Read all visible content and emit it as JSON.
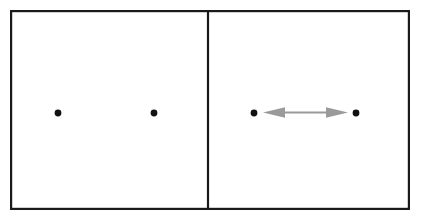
{
  "figure": {
    "background_color": "#ffffff",
    "width": 421,
    "height": 222,
    "frame": {
      "name": "outer-rectangle",
      "x": 10,
      "y": 10,
      "width": 400,
      "height": 200,
      "stroke_color": "#1a1a1a",
      "stroke_width": 2.2,
      "fill_color": "#ffffff"
    },
    "divider": {
      "name": "vertical-divider",
      "x": 208,
      "y_top": 10,
      "y_bottom": 210,
      "stroke_color": "#1a1a1a",
      "stroke_width": 2.2
    },
    "panels": [
      {
        "id": "left-panel",
        "label": "",
        "has_arrow": false,
        "dots": [
          {
            "id": "left-panel-dot-1",
            "cx": 58,
            "cy": 113,
            "r": 3.4,
            "color": "#111111"
          },
          {
            "id": "left-panel-dot-2",
            "cx": 154,
            "cy": 113,
            "r": 3.4,
            "color": "#111111"
          }
        ]
      },
      {
        "id": "right-panel",
        "label": "",
        "has_arrow": true,
        "dots": [
          {
            "id": "right-panel-dot-1",
            "cx": 254,
            "cy": 113,
            "r": 3.4,
            "color": "#111111"
          },
          {
            "id": "right-panel-dot-2",
            "cx": 356,
            "cy": 113,
            "r": 3.4,
            "color": "#111111"
          }
        ],
        "arrow": {
          "id": "double-headed-arrow",
          "color": "#9a9a9a",
          "y": 112.5,
          "x_start": 263,
          "x_end": 348,
          "shaft_width": 2.2,
          "head_length": 22,
          "head_half_height": 5.2,
          "heads": "both"
        }
      }
    ]
  }
}
